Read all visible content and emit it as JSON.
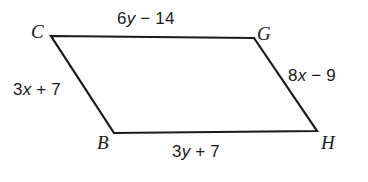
{
  "figure": {
    "type": "parallelogram",
    "shape_name": "CGHB",
    "stroke_color": "#1a1a1a",
    "background_color": "#ffffff",
    "stroke_width": 2.2,
    "vertices": [
      {
        "name": "C",
        "label": "C",
        "x": 51,
        "y": 36
      },
      {
        "name": "G",
        "label": "G",
        "x": 254,
        "y": 38
      },
      {
        "name": "H",
        "label": "H",
        "x": 317,
        "y": 131
      },
      {
        "name": "B",
        "label": "B",
        "x": 114,
        "y": 133
      }
    ],
    "side_labels": {
      "top": {
        "side": "CG",
        "prefix": "6",
        "variable": "y",
        "operator": " − ",
        "constant": "14",
        "text": "6y − 14"
      },
      "left": {
        "side": "CB",
        "prefix": "3",
        "variable": "x",
        "operator": " + ",
        "constant": "7",
        "text": "3x + 7"
      },
      "right": {
        "side": "GH",
        "prefix": "8",
        "variable": "x",
        "operator": " − ",
        "constant": "9",
        "text": "8x − 9"
      },
      "bottom": {
        "side": "BH",
        "prefix": "3",
        "variable": "y",
        "operator": " + ",
        "constant": "7",
        "text": "3y + 7"
      }
    }
  }
}
